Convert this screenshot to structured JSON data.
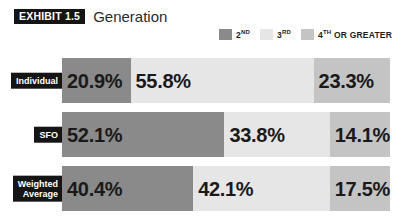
{
  "header": {
    "exhibit_badge": "EXHIBIT 1.5",
    "title": "Generation"
  },
  "colors": {
    "second": "#8a8a8a",
    "third": "#e6e6e6",
    "fourth_or_greater": "#c4c4c4",
    "badge_bg": "#151515",
    "badge_text": "#ffffff",
    "value_text": "#1a1a1a",
    "background": "#ffffff"
  },
  "legend": {
    "items": [
      {
        "label": "2",
        "ordinal": "ND",
        "color_key": "second"
      },
      {
        "label": "3",
        "ordinal": "RD",
        "color_key": "third"
      },
      {
        "label": "4",
        "ordinal": "TH",
        "suffix": " OR GREATER",
        "color_key": "fourth_or_greater"
      }
    ]
  },
  "chart_data": {
    "type": "bar",
    "orientation": "horizontal",
    "stacked": true,
    "normalized_percent": true,
    "title": "Generation",
    "xlabel": "",
    "ylabel": "",
    "xlim": [
      0,
      100
    ],
    "grid": false,
    "legend_position": "top-right",
    "categories": [
      "Individual",
      "SFO",
      "Weighted Average"
    ],
    "series": [
      {
        "name": "2ND",
        "values": [
          20.9,
          52.1,
          40.4
        ],
        "color": "#8a8a8a"
      },
      {
        "name": "3RD",
        "values": [
          55.8,
          33.8,
          42.1
        ],
        "color": "#e6e6e6"
      },
      {
        "name": "4TH OR GREATER",
        "values": [
          23.3,
          14.1,
          17.5
        ],
        "color": "#c4c4c4"
      }
    ]
  },
  "rows": [
    {
      "label": "Individual",
      "segments": [
        {
          "value_text": "20.9%",
          "pct": 20.9,
          "color_key": "second",
          "align": "left"
        },
        {
          "value_text": "55.8%",
          "pct": 55.8,
          "color_key": "third",
          "align": "left"
        },
        {
          "value_text": "23.3%",
          "pct": 23.3,
          "color_key": "fourth_or_greater",
          "align": "left"
        }
      ]
    },
    {
      "label": "SFO",
      "segments": [
        {
          "value_text": "52.1%",
          "pct": 52.1,
          "color_key": "second",
          "align": "left"
        },
        {
          "value_text": "33.8%",
          "pct": 33.8,
          "color_key": "third",
          "align": "left"
        },
        {
          "value_text": "14.1%",
          "pct": 14.1,
          "color_key": "fourth_or_greater",
          "align": "left"
        }
      ]
    },
    {
      "label": "Weighted\nAverage",
      "segments": [
        {
          "value_text": "40.4%",
          "pct": 40.4,
          "color_key": "second",
          "align": "left"
        },
        {
          "value_text": "42.1%",
          "pct": 42.1,
          "color_key": "third",
          "align": "left"
        },
        {
          "value_text": "17.5%",
          "pct": 17.5,
          "color_key": "fourth_or_greater",
          "align": "left"
        }
      ]
    }
  ]
}
